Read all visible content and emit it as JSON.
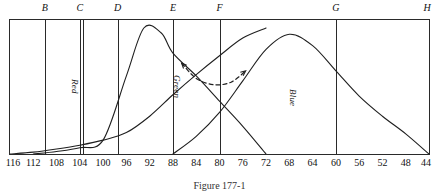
{
  "figure": {
    "caption": "Figure 177-1",
    "frame": {
      "line_color": "#2a2a2a"
    }
  },
  "top_markers": [
    {
      "label": "B",
      "value": 110
    },
    {
      "label": "C",
      "value": 104
    },
    {
      "label": "D",
      "value": 97.5
    },
    {
      "label": "E",
      "value": 88
    },
    {
      "label": "F",
      "value": 80
    },
    {
      "label": "G",
      "value": 60
    },
    {
      "label": "H",
      "value": 44
    }
  ],
  "extra_divider": {
    "label": "C-inner",
    "value": 103.4
  },
  "curve_labels": [
    {
      "label": "Red",
      "value": 104.9,
      "y_px": 78
    },
    {
      "label": "Green",
      "value": 87.3,
      "y_px": 74
    },
    {
      "label": "Blue",
      "value": 67.3,
      "y_px": 88
    }
  ],
  "axis": {
    "min": 44,
    "max": 116,
    "tick_step": 4,
    "ticks": [
      116,
      112,
      108,
      104,
      100,
      96,
      92,
      88,
      84,
      80,
      76,
      72,
      68,
      64,
      60,
      56,
      52,
      48,
      44
    ],
    "direction": "descending"
  },
  "chart_data": {
    "type": "line",
    "title": "Figure 177-1",
    "xlabel": "",
    "ylabel": "",
    "xlim": [
      116,
      44
    ],
    "ylim": [
      0,
      1
    ],
    "grid": false,
    "legend": "inline-rotated-labels",
    "x_axis_direction": "descending",
    "series": [
      {
        "name": "Red",
        "style": "solid",
        "comment": "rises slowly from ~116, steep climb after 96, falls to baseline near 72",
        "x": [
          116,
          112,
          108,
          104,
          100,
          96,
          92,
          88,
          84,
          80,
          76,
          72
        ],
        "values": [
          0.0,
          0.015,
          0.04,
          0.07,
          0.11,
          0.17,
          0.3,
          0.47,
          0.63,
          0.78,
          0.92,
          1.0
        ]
      },
      {
        "name": "Green",
        "style": "solid",
        "comment": "broad peak centred near 93, decays to baseline near 72",
        "x": [
          112,
          108,
          104,
          100,
          96,
          93,
          90,
          88,
          84,
          80,
          76,
          72
        ],
        "values": [
          0.0,
          0.02,
          0.05,
          0.11,
          0.62,
          1.0,
          0.96,
          0.8,
          0.62,
          0.42,
          0.22,
          0.0
        ]
      },
      {
        "name": "Blue",
        "style": "solid",
        "comment": "starts at 88, peaks near 68, tails off to 44",
        "x": [
          88,
          84,
          80,
          76,
          72,
          68,
          64,
          60,
          56,
          52,
          48,
          44
        ],
        "values": [
          0.0,
          0.14,
          0.33,
          0.58,
          0.83,
          0.95,
          0.86,
          0.66,
          0.46,
          0.3,
          0.16,
          0.0
        ]
      },
      {
        "name": "transition-arrow",
        "style": "dashed",
        "arrows": "both-ends",
        "comment": "dashed arc spanning the green fall-off to the blue rise",
        "x": [
          86.5,
          84,
          81,
          78,
          75.5
        ],
        "values": [
          0.72,
          0.6,
          0.55,
          0.57,
          0.66
        ]
      }
    ]
  }
}
